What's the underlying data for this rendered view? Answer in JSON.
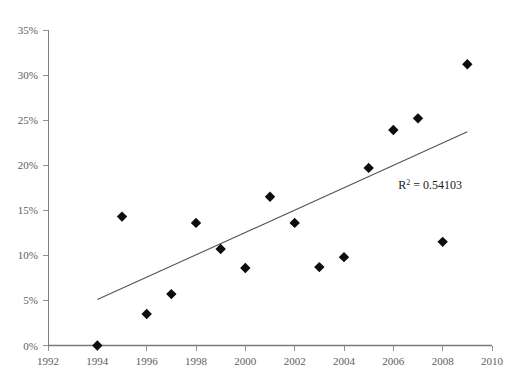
{
  "chart_data": {
    "type": "scatter",
    "title": "",
    "xlabel": "",
    "ylabel": "",
    "xlim": [
      1992,
      2010
    ],
    "ylim": [
      0,
      35
    ],
    "grid": false,
    "legend": null,
    "x_ticks": [
      "1992",
      "1994",
      "1996",
      "1998",
      "2000",
      "2002",
      "2004",
      "2006",
      "2008",
      "2010"
    ],
    "x_tick_values": [
      1992,
      1994,
      1996,
      1998,
      2000,
      2002,
      2004,
      2006,
      2008,
      2010
    ],
    "y_ticks": [
      "0%",
      "5%",
      "10%",
      "15%",
      "20%",
      "25%",
      "30%",
      "35%"
    ],
    "y_tick_values": [
      0,
      5,
      10,
      15,
      20,
      25,
      30,
      35
    ],
    "x": [
      1994,
      1995,
      1996,
      1997,
      1998,
      1999,
      2000,
      2001,
      2002,
      2003,
      2004,
      2005,
      2006,
      2007,
      2008,
      2009
    ],
    "values": [
      0.0,
      14.3,
      3.5,
      5.7,
      13.6,
      10.7,
      8.6,
      16.5,
      13.6,
      8.7,
      9.8,
      19.7,
      23.9,
      25.2,
      11.5,
      31.2
    ],
    "marker": "diamond",
    "marker_color": "#0d0d0d",
    "trendline": {
      "type": "linear",
      "x_start": 1994.0,
      "y_start": 5.1,
      "x_end": 2009.0,
      "y_end": 23.7,
      "color": "#555555"
    },
    "annotations": [
      {
        "name": "r-squared",
        "text_prefix": "R",
        "text_sup": "2",
        "text_suffix": " = 0.54103",
        "full_text": "R2 = 0.54103",
        "x": 2006.2,
        "y": 17.4
      }
    ]
  },
  "axes": {
    "x_axis_color": "#7a7a7a",
    "y_axis_color": "#808080"
  }
}
